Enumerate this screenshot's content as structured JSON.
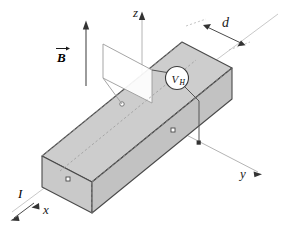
{
  "figure": {
    "type": "physics-diagram",
    "background_color": "#ffffff"
  },
  "axes": {
    "x": {
      "label": "x",
      "description": "axis toward lower-left front"
    },
    "y": {
      "label": "y",
      "description": "axis toward lower-right"
    },
    "z": {
      "label": "z",
      "description": "vertical axis upward"
    }
  },
  "labels": {
    "magnetic_field": "B",
    "current": "I",
    "width_dimension": "d",
    "hall_voltage": "V",
    "hall_voltage_subscript": "H"
  },
  "colors": {
    "slab_top_face": "#cdcdcd",
    "slab_front_face": "#c4c4c4",
    "slab_end_face": "#bcbcbc",
    "outline": "#4a4a4a",
    "axis_line": "#b0b0b0",
    "hidden_line": "#9a9a9a",
    "wire": "#555555",
    "text": "#1a1a1a",
    "cross_section_fill": "#ffffff",
    "cross_section_stroke": "#8a8a8a"
  },
  "markers": {
    "left_end_contact": "square",
    "right_front_contact": "square",
    "cross_section_point": "circle",
    "wire_terminal": "square-solid"
  },
  "geometry": {
    "slab_description": "rectangular conducting bar in isometric projection",
    "cross_section_description": "white parallelogram plane cutting the bar perpendicular to its length"
  }
}
